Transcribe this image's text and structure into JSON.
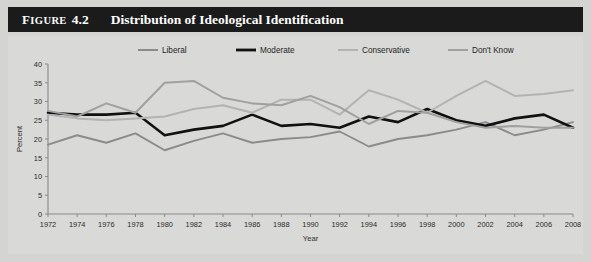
{
  "header": {
    "figure_word": "Figure",
    "figure_number": "4.2",
    "title": "Distribution of Ideological Identification",
    "bar_color": "#1b1b1b",
    "text_color": "#ffffff"
  },
  "chart_data": {
    "type": "line",
    "title": "Distribution of Ideological Identification",
    "xlabel": "Year",
    "ylabel": "Percent",
    "xlim": [
      1972,
      2008
    ],
    "ylim": [
      0,
      40
    ],
    "ytick_step": 5,
    "yticks": [
      "0",
      "5",
      "10",
      "15",
      "20",
      "25",
      "30",
      "35",
      "40"
    ],
    "grid": false,
    "legend_position": "top",
    "background": "#d9d9d7",
    "axis_color": "#8a8a8a",
    "categories": [
      1972,
      1974,
      1976,
      1978,
      1980,
      1982,
      1984,
      1986,
      1988,
      1990,
      1992,
      1994,
      1996,
      1998,
      2000,
      2002,
      2004,
      2006,
      2008
    ],
    "xtick_labels": [
      "1972",
      "1974",
      "1976",
      "1978",
      "1980",
      "1982",
      "1984",
      "1986",
      "1988",
      "1990",
      "1992",
      "1994",
      "1996",
      "1998",
      "2000",
      "2002",
      "2004",
      "2006",
      "2008"
    ],
    "series": [
      {
        "name": "Liberal",
        "color": "#8b8b8b",
        "width": 1.9,
        "values": [
          18.5,
          21.0,
          19.0,
          21.5,
          17.0,
          19.5,
          21.5,
          19.0,
          20.0,
          20.5,
          22.0,
          18.0,
          20.0,
          21.0,
          22.5,
          24.5,
          21.0,
          22.5,
          24.5
        ]
      },
      {
        "name": "Moderate",
        "color": "#111111",
        "width": 2.6,
        "values": [
          27.0,
          26.5,
          26.5,
          27.0,
          21.0,
          22.5,
          23.5,
          26.5,
          23.5,
          24.0,
          23.0,
          26.0,
          24.5,
          28.0,
          25.0,
          23.5,
          25.5,
          26.5,
          23.0
        ]
      },
      {
        "name": "Conservative",
        "color": "#b3b3b3",
        "width": 2.0,
        "values": [
          26.5,
          25.5,
          25.0,
          25.5,
          26.0,
          28.0,
          29.0,
          27.0,
          30.5,
          30.5,
          26.5,
          33.0,
          30.5,
          27.0,
          31.5,
          35.5,
          31.5,
          32.0,
          33.0
        ]
      },
      {
        "name": "Don't Know",
        "color": "#a0a0a0",
        "width": 2.0,
        "values": [
          27.5,
          26.0,
          29.5,
          27.0,
          35.0,
          35.5,
          31.0,
          29.5,
          29.0,
          31.5,
          28.5,
          24.0,
          27.5,
          27.0,
          24.5,
          23.0,
          23.5,
          23.0,
          23.0
        ]
      }
    ]
  },
  "legend": {
    "entries": [
      {
        "label": "Liberal",
        "color": "#8b8b8b",
        "width": 2.0
      },
      {
        "label": "Moderate",
        "color": "#111111",
        "width": 2.8
      },
      {
        "label": "Conservative",
        "color": "#b3b3b3",
        "width": 2.0
      },
      {
        "label": "Don't Know",
        "color": "#a0a0a0",
        "width": 2.0
      }
    ]
  }
}
